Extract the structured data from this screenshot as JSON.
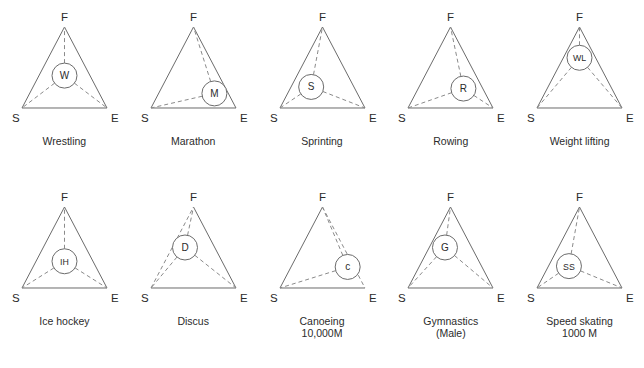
{
  "figure": {
    "title": "",
    "vertex_labels": {
      "S": "S",
      "E": "E",
      "F": "F"
    },
    "colors": {
      "line": "#6a6a6a",
      "dashed": "#8a8a8a",
      "text": "#2b2b2b",
      "background": "#ffffff"
    }
  },
  "chart_data": {
    "type": "scatter",
    "title": "",
    "xlabel": "",
    "ylabel": "",
    "axes": [
      "S",
      "E",
      "F"
    ],
    "panels": [
      {
        "id": "wrestling",
        "label": "Wrestling",
        "caption_line2": "",
        "node_label": "W",
        "node": {
          "S": 0.34,
          "E": 0.33,
          "F": 0.33
        },
        "node_xy": [
          0.5,
          0.4
        ],
        "edges": {
          "SF": "solid",
          "FE": "solid",
          "SE": "solid"
        },
        "spokes": [
          "F",
          "S",
          "E"
        ]
      },
      {
        "id": "marathon",
        "label": "Marathon",
        "caption_line2": "",
        "node_label": "M",
        "node": {
          "S": 0.12,
          "E": 0.7,
          "F": 0.18
        },
        "node_xy": [
          0.8,
          0.18
        ],
        "edges": {
          "SF": "solid",
          "FE": "solid",
          "SE": "solid"
        },
        "spokes": [
          "F",
          "S"
        ]
      },
      {
        "id": "sprinting",
        "label": "Sprinting",
        "caption_line2": "",
        "node_label": "S",
        "node": {
          "S": 0.48,
          "E": 0.26,
          "F": 0.26
        },
        "node_xy": [
          0.32,
          0.26
        ],
        "edges": {
          "SF": "solid",
          "FE": "solid",
          "SE": "solid"
        },
        "spokes": [
          "F",
          "S",
          "E"
        ]
      },
      {
        "id": "rowing",
        "label": "Rowing",
        "caption_line2": "",
        "node_label": "R",
        "node": {
          "S": 0.2,
          "E": 0.56,
          "F": 0.24
        },
        "node_xy": [
          0.7,
          0.24
        ],
        "edges": {
          "SF": "solid",
          "FE": "solid",
          "SE": "solid"
        },
        "spokes": [
          "F",
          "S",
          "E"
        ]
      },
      {
        "id": "weight-lifting",
        "label": "Weight lifting",
        "caption_line2": "",
        "node_label": "WL",
        "node": {
          "S": 0.27,
          "E": 0.23,
          "F": 0.5
        },
        "node_xy": [
          0.5,
          0.62
        ],
        "edges": {
          "SF": "solid",
          "FE": "solid",
          "SE": "solid"
        },
        "spokes": [
          "F",
          "S",
          "E"
        ]
      },
      {
        "id": "ice-hockey",
        "label": "Ice hockey",
        "caption_line2": "",
        "node_label": "IH",
        "node": {
          "S": 0.34,
          "E": 0.33,
          "F": 0.33
        },
        "node_xy": [
          0.5,
          0.33
        ],
        "edges": {
          "SF": "solid",
          "FE": "solid",
          "SE": "solid"
        },
        "spokes": [
          "F",
          "S",
          "E"
        ]
      },
      {
        "id": "discus",
        "label": "Discus",
        "caption_line2": "",
        "node_label": "D",
        "node": {
          "S": 0.45,
          "E": 0.18,
          "F": 0.37
        },
        "node_xy": [
          0.3,
          0.5
        ],
        "edges": {
          "SF": "dashed",
          "FE": "solid",
          "SE": "solid"
        },
        "spokes": [
          "F",
          "S",
          "E"
        ]
      },
      {
        "id": "canoeing",
        "label": "Canoeing",
        "caption_line2": "10,000M",
        "node_label": "c",
        "node": {
          "S": 0.1,
          "E": 0.72,
          "F": 0.18
        },
        "node_xy": [
          0.9,
          0.26
        ],
        "edges": {
          "SF": "solid",
          "FE": "dashed",
          "SE": "solid"
        },
        "spokes": [
          "F",
          "S"
        ]
      },
      {
        "id": "gymnastics",
        "label": "Gymnastics",
        "caption_line2": "(Male)",
        "node_label": "G",
        "node": {
          "S": 0.4,
          "E": 0.18,
          "F": 0.42
        },
        "node_xy": [
          0.37,
          0.5
        ],
        "edges": {
          "SF": "solid",
          "FE": "solid",
          "SE": "solid"
        },
        "spokes": [
          "F",
          "S",
          "E"
        ]
      },
      {
        "id": "speed-skating",
        "label": "Speed skating",
        "caption_line2": "1000 M",
        "node_label": "SS",
        "node": {
          "S": 0.44,
          "E": 0.28,
          "F": 0.28
        },
        "node_xy": [
          0.33,
          0.27
        ],
        "edges": {
          "SF": "solid",
          "FE": "solid",
          "SE": "solid"
        },
        "spokes": [
          "F",
          "S",
          "E"
        ]
      }
    ]
  }
}
